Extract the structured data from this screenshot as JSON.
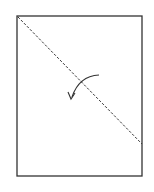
{
  "diagram": {
    "type": "paper-folding-step",
    "paper": {
      "x": 17,
      "y": 16,
      "width": 125,
      "height": 160,
      "stroke": "#333333"
    },
    "fold_line": {
      "style": "dashed",
      "from": [
        17,
        16
      ],
      "to": [
        142,
        144
      ],
      "stroke": "#333333"
    },
    "fold_arrow": {
      "direction": "counter-clockwise",
      "start": [
        99,
        75
      ],
      "end": [
        71,
        98
      ],
      "stroke": "#333333"
    }
  }
}
